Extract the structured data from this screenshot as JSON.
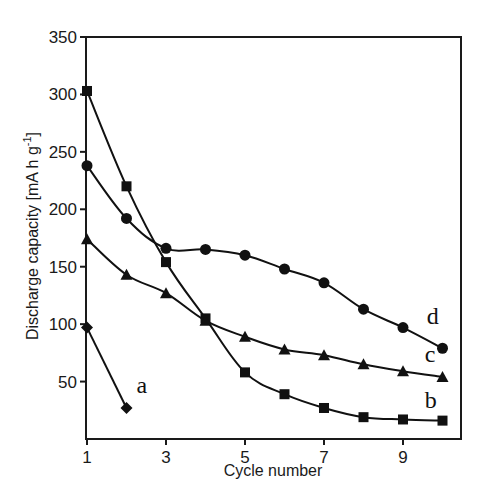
{
  "chart_data": {
    "type": "line",
    "title": "",
    "xlabel": "Cycle number",
    "ylabel": "Discharge capacity [mA h g",
    "ylabel_sup": "-1",
    "ylabel_end": "]",
    "xlim": [
      1,
      10.5
    ],
    "ylim": [
      0,
      350
    ],
    "x_ticks": [
      1,
      3,
      5,
      7,
      9
    ],
    "y_ticks": [
      50,
      100,
      150,
      200,
      250,
      300,
      350
    ],
    "grid": false,
    "legend": "inline labels at series ends",
    "series": [
      {
        "name": "a",
        "marker": "diamond",
        "x": [
          1,
          2
        ],
        "values": [
          97,
          27
        ]
      },
      {
        "name": "b",
        "marker": "square",
        "x": [
          1,
          2,
          3,
          4,
          5,
          6,
          7,
          8,
          9,
          10
        ],
        "values": [
          303,
          220,
          154,
          105,
          58,
          39,
          27,
          19,
          17,
          16
        ]
      },
      {
        "name": "c",
        "marker": "triangle",
        "x": [
          1,
          2,
          3,
          4,
          5,
          6,
          7,
          8,
          9,
          10
        ],
        "values": [
          174,
          143,
          127,
          103,
          89,
          78,
          73,
          65,
          59,
          54
        ]
      },
      {
        "name": "d",
        "marker": "circle",
        "x": [
          1,
          2,
          3,
          4,
          5,
          6,
          7,
          8,
          9,
          10
        ],
        "values": [
          238,
          192,
          166,
          165,
          160,
          148,
          136,
          113,
          97,
          79
        ]
      }
    ],
    "annotations": [
      {
        "text": "a",
        "series": "a",
        "x": 2.25,
        "y": 40
      },
      {
        "text": "b",
        "series": "b",
        "x": 9.55,
        "y": 27
      },
      {
        "text": "c",
        "series": "c",
        "x": 9.55,
        "y": 67
      },
      {
        "text": "d",
        "series": "d",
        "x": 9.6,
        "y": 100
      }
    ]
  }
}
